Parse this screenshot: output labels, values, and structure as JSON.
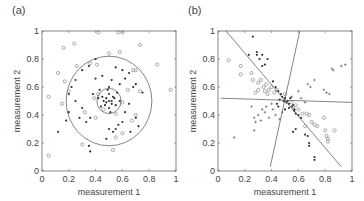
{
  "chart_data": [
    {
      "panel": "(a)",
      "type": "scatter",
      "title": "",
      "xlabel": "measurement 1",
      "ylabel": "measurement 2",
      "xlim": [
        0,
        1
      ],
      "ylim": [
        0,
        1
      ],
      "xticks": [
        "0",
        "0.2",
        "0.4",
        "0.6",
        "0.8",
        "1"
      ],
      "yticks": [
        "0",
        "0.2",
        "0.4",
        "0.6",
        "0.8",
        "1"
      ],
      "grid": false,
      "legend": null,
      "annotations": [
        {
          "type": "circle",
          "cx": 0.5,
          "cy": 0.5,
          "r": 0.09
        },
        {
          "type": "circle",
          "cx": 0.5,
          "cy": 0.5,
          "r": 0.32
        }
      ],
      "series": [
        {
          "name": "filled",
          "marker": "dot",
          "points": [
            [
              0.5,
              0.5
            ],
            [
              0.48,
              0.52
            ],
            [
              0.52,
              0.48
            ],
            [
              0.46,
              0.5
            ],
            [
              0.54,
              0.52
            ],
            [
              0.5,
              0.55
            ],
            [
              0.5,
              0.45
            ],
            [
              0.47,
              0.47
            ],
            [
              0.53,
              0.53
            ],
            [
              0.45,
              0.53
            ],
            [
              0.55,
              0.47
            ],
            [
              0.49,
              0.58
            ],
            [
              0.51,
              0.42
            ],
            [
              0.44,
              0.46
            ],
            [
              0.56,
              0.56
            ],
            [
              0.52,
              0.5
            ],
            [
              0.48,
              0.49
            ],
            [
              0.58,
              0.5
            ],
            [
              0.42,
              0.52
            ],
            [
              0.5,
              0.6
            ],
            [
              0.3,
              0.72
            ],
            [
              0.35,
              0.75
            ],
            [
              0.4,
              0.66
            ],
            [
              0.25,
              0.65
            ],
            [
              0.2,
              0.55
            ],
            [
              0.22,
              0.6
            ],
            [
              0.62,
              0.66
            ],
            [
              0.7,
              0.62
            ],
            [
              0.65,
              0.7
            ],
            [
              0.75,
              0.56
            ],
            [
              0.68,
              0.6
            ],
            [
              0.6,
              0.72
            ],
            [
              0.55,
              0.74
            ],
            [
              0.38,
              0.55
            ],
            [
              0.3,
              0.45
            ],
            [
              0.28,
              0.38
            ],
            [
              0.33,
              0.35
            ],
            [
              0.6,
              0.35
            ],
            [
              0.7,
              0.38
            ],
            [
              0.72,
              0.32
            ],
            [
              0.55,
              0.3
            ],
            [
              0.53,
              0.28
            ],
            [
              0.5,
              0.3
            ],
            [
              0.48,
              0.23
            ],
            [
              0.35,
              0.18
            ],
            [
              0.36,
              0.14
            ],
            [
              0.12,
              0.28
            ],
            [
              0.18,
              0.36
            ],
            [
              0.2,
              0.42
            ],
            [
              0.66,
              0.28
            ],
            [
              0.57,
              0.33
            ],
            [
              0.62,
              0.42
            ],
            [
              0.45,
              0.68
            ],
            [
              0.4,
              0.8
            ],
            [
              0.36,
              0.38
            ],
            [
              0.25,
              0.5
            ],
            [
              0.58,
              0.62
            ],
            [
              0.65,
              0.48
            ],
            [
              0.43,
              0.58
            ],
            [
              0.52,
              0.65
            ]
          ]
        },
        {
          "name": "open",
          "marker": "circle",
          "points": [
            [
              0.42,
              0.99
            ],
            [
              0.57,
              0.99
            ],
            [
              0.6,
              0.99
            ],
            [
              0.24,
              0.91
            ],
            [
              0.16,
              0.88
            ],
            [
              0.73,
              0.9
            ],
            [
              0.5,
              0.84
            ],
            [
              0.58,
              0.85
            ],
            [
              0.86,
              0.76
            ],
            [
              0.26,
              0.75
            ],
            [
              0.36,
              0.77
            ],
            [
              0.41,
              0.76
            ],
            [
              0.12,
              0.7
            ],
            [
              0.68,
              0.72
            ],
            [
              0.7,
              0.72
            ],
            [
              0.17,
              0.64
            ],
            [
              0.2,
              0.57
            ],
            [
              0.73,
              0.57
            ],
            [
              0.96,
              0.58
            ],
            [
              0.05,
              0.53
            ],
            [
              0.15,
              0.48
            ],
            [
              0.64,
              0.58
            ],
            [
              0.32,
              0.42
            ],
            [
              0.4,
              0.38
            ],
            [
              0.67,
              0.36
            ],
            [
              0.7,
              0.4
            ],
            [
              0.6,
              0.27
            ],
            [
              0.55,
              0.24
            ],
            [
              0.3,
              0.19
            ],
            [
              0.05,
              0.11
            ],
            [
              0.53,
              0.15
            ],
            [
              0.42,
              0.55
            ],
            [
              0.6,
              0.49
            ],
            [
              0.46,
              0.44
            ],
            [
              0.55,
              0.41
            ],
            [
              0.39,
              0.52
            ]
          ]
        }
      ]
    },
    {
      "panel": "(b)",
      "type": "scatter",
      "title": "",
      "xlabel": "measurement 1",
      "ylabel": "measurement 2",
      "xlim": [
        0,
        1
      ],
      "ylim": [
        0,
        1
      ],
      "xticks": [
        "0",
        "0.2",
        "0.4",
        "0.6",
        "0.8",
        "1"
      ],
      "yticks": [
        "0",
        "0.2",
        "0.4",
        "0.6",
        "0.8",
        "1"
      ],
      "grid": false,
      "legend": null,
      "annotations": [
        {
          "type": "line",
          "x1": 0.06,
          "y1": 1.0,
          "x2": 0.92,
          "y2": 0.03
        },
        {
          "type": "line",
          "x1": 0.61,
          "y1": 1.0,
          "x2": 0.39,
          "y2": 0.03
        },
        {
          "type": "line",
          "x1": 0.02,
          "y1": 0.52,
          "x2": 1.0,
          "y2": 0.49
        }
      ],
      "series": [
        {
          "name": "filled",
          "marker": "dot",
          "points": [
            [
              0.26,
              0.96
            ],
            [
              0.23,
              0.83
            ],
            [
              0.29,
              0.85
            ],
            [
              0.29,
              0.83
            ],
            [
              0.33,
              0.83
            ],
            [
              0.31,
              0.8
            ],
            [
              0.37,
              0.8
            ],
            [
              0.33,
              0.75
            ],
            [
              0.35,
              0.76
            ],
            [
              0.41,
              0.64
            ],
            [
              0.43,
              0.6
            ],
            [
              0.45,
              0.57
            ],
            [
              0.47,
              0.55
            ],
            [
              0.48,
              0.53
            ],
            [
              0.5,
              0.52
            ],
            [
              0.52,
              0.5
            ],
            [
              0.53,
              0.48
            ],
            [
              0.55,
              0.46
            ],
            [
              0.57,
              0.44
            ],
            [
              0.46,
              0.51
            ],
            [
              0.51,
              0.49
            ],
            [
              0.49,
              0.5
            ],
            [
              0.54,
              0.52
            ],
            [
              0.56,
              0.47
            ],
            [
              0.44,
              0.48
            ],
            [
              0.58,
              0.41
            ],
            [
              0.57,
              0.43
            ],
            [
              0.62,
              0.38
            ],
            [
              0.6,
              0.4
            ],
            [
              0.53,
              0.45
            ],
            [
              0.56,
              0.28
            ],
            [
              0.58,
              0.3
            ],
            [
              0.65,
              0.26
            ],
            [
              0.67,
              0.25
            ],
            [
              0.68,
              0.2
            ],
            [
              0.68,
              0.18
            ],
            [
              0.72,
              0.1
            ],
            [
              0.72,
              0.08
            ],
            [
              0.45,
              0.46
            ],
            [
              0.5,
              0.44
            ]
          ]
        },
        {
          "name": "plus",
          "marker": "plus",
          "points": [
            [
              0.85,
              0.73
            ],
            [
              0.86,
              0.72
            ],
            [
              0.92,
              0.75
            ],
            [
              0.95,
              0.76
            ],
            [
              0.67,
              0.62
            ],
            [
              0.69,
              0.6
            ],
            [
              0.72,
              0.65
            ],
            [
              0.79,
              0.58
            ],
            [
              0.81,
              0.56
            ],
            [
              0.83,
              0.55
            ],
            [
              0.6,
              0.57
            ],
            [
              0.62,
              0.52
            ],
            [
              0.65,
              0.49
            ],
            [
              0.25,
              0.46
            ],
            [
              0.27,
              0.38
            ],
            [
              0.28,
              0.35
            ],
            [
              0.3,
              0.4
            ],
            [
              0.32,
              0.36
            ],
            [
              0.35,
              0.42
            ],
            [
              0.38,
              0.38
            ],
            [
              0.41,
              0.44
            ],
            [
              0.43,
              0.4
            ],
            [
              0.46,
              0.37
            ],
            [
              0.27,
              0.29
            ],
            [
              0.12,
              0.24
            ],
            [
              0.36,
              0.46
            ],
            [
              0.33,
              0.44
            ],
            [
              0.4,
              0.48
            ],
            [
              0.55,
              0.53
            ],
            [
              0.48,
              0.42
            ]
          ]
        },
        {
          "name": "open",
          "marker": "circle",
          "points": [
            [
              0.08,
              0.79
            ],
            [
              0.17,
              0.75
            ],
            [
              0.17,
              0.69
            ],
            [
              0.25,
              0.7
            ],
            [
              0.26,
              0.65
            ],
            [
              0.3,
              0.63
            ],
            [
              0.32,
              0.65
            ],
            [
              0.34,
              0.6
            ],
            [
              0.36,
              0.62
            ],
            [
              0.38,
              0.58
            ],
            [
              0.4,
              0.6
            ],
            [
              0.42,
              0.56
            ],
            [
              0.44,
              0.58
            ],
            [
              0.37,
              0.55
            ],
            [
              0.35,
              0.57
            ],
            [
              0.3,
              0.58
            ],
            [
              0.28,
              0.56
            ],
            [
              0.5,
              0.55
            ],
            [
              0.56,
              0.46
            ],
            [
              0.6,
              0.44
            ],
            [
              0.63,
              0.41
            ],
            [
              0.66,
              0.41
            ],
            [
              0.68,
              0.4
            ],
            [
              0.7,
              0.35
            ],
            [
              0.72,
              0.33
            ],
            [
              0.74,
              0.32
            ],
            [
              0.79,
              0.38
            ],
            [
              0.8,
              0.29
            ],
            [
              0.81,
              0.25
            ],
            [
              0.82,
              0.23
            ],
            [
              0.82,
              0.21
            ],
            [
              0.87,
              0.29
            ],
            [
              0.65,
              0.32
            ],
            [
              0.55,
              0.49
            ],
            [
              0.58,
              0.47
            ]
          ]
        }
      ]
    }
  ]
}
